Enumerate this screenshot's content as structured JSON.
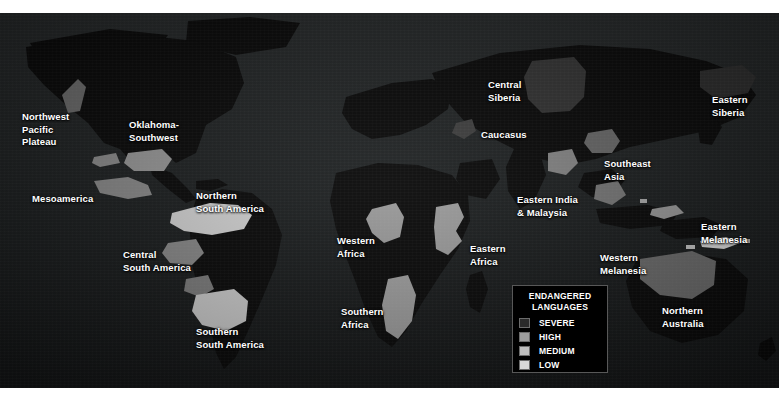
{
  "map": {
    "background_color": "#1d1f1f",
    "land_color": "#0a0a0a",
    "page_background": "#ffffff",
    "label_color": "#ffffff"
  },
  "legend": {
    "title": "ENDANGERED\nLANGUAGES",
    "border_color": "#585858",
    "background_color": "#000000",
    "items": [
      {
        "label": "SEVERE",
        "color": "#2a2a2a"
      },
      {
        "label": "HIGH",
        "color": "#9c9c9c"
      },
      {
        "label": "MEDIUM",
        "color": "#bdbdbd"
      },
      {
        "label": "LOW",
        "color": "#d8d8d8"
      }
    ]
  },
  "regions": [
    {
      "name": "Northwest Pacific Plateau",
      "label": "Northwest\nPacific\nPlateau",
      "x": 22,
      "y": 98,
      "align": "l"
    },
    {
      "name": "Oklahoma-Southwest",
      "label": "Oklahoma-\nSouthwest",
      "x": 129,
      "y": 106,
      "align": "l"
    },
    {
      "name": "Mesoamerica",
      "label": "Mesoamerica",
      "x": 32,
      "y": 180,
      "align": "l"
    },
    {
      "name": "Northern South America",
      "label": "Northern\nSouth America",
      "x": 196,
      "y": 177,
      "align": "l"
    },
    {
      "name": "Central South America",
      "label": "Central\nSouth America",
      "x": 123,
      "y": 236,
      "align": "l"
    },
    {
      "name": "Southern South America",
      "label": "Southern\nSouth America",
      "x": 196,
      "y": 313,
      "align": "l"
    },
    {
      "name": "Western Africa",
      "label": "Western\nAfrica",
      "x": 337,
      "y": 222,
      "align": "l"
    },
    {
      "name": "Eastern Africa",
      "label": "Eastern\nAfrica",
      "x": 470,
      "y": 230,
      "align": "l"
    },
    {
      "name": "Southern Africa",
      "label": "Southern\nAfrica",
      "x": 341,
      "y": 293,
      "align": "l"
    },
    {
      "name": "Central Siberia",
      "label": "Central\nSiberia",
      "x": 488,
      "y": 66,
      "align": "l"
    },
    {
      "name": "Caucasus",
      "label": "Caucasus",
      "x": 481,
      "y": 116,
      "align": "l"
    },
    {
      "name": "Eastern Siberia",
      "label": "Eastern\nSiberia",
      "x": 712,
      "y": 81,
      "align": "l"
    },
    {
      "name": "Southeast Asia",
      "label": "Southeast\nAsia",
      "x": 604,
      "y": 145,
      "align": "l"
    },
    {
      "name": "Eastern India & Malaysia",
      "label": "Eastern India\n& Malaysia",
      "x": 517,
      "y": 181,
      "align": "l"
    },
    {
      "name": "Eastern Melanesia",
      "label": "Eastern\nMelanesia",
      "x": 701,
      "y": 208,
      "align": "l"
    },
    {
      "name": "Western Melanesia",
      "label": "Western\nMelanesia",
      "x": 600,
      "y": 239,
      "align": "l"
    },
    {
      "name": "Northern Australia",
      "label": "Northern\nAustralia",
      "x": 662,
      "y": 292,
      "align": "l"
    }
  ]
}
